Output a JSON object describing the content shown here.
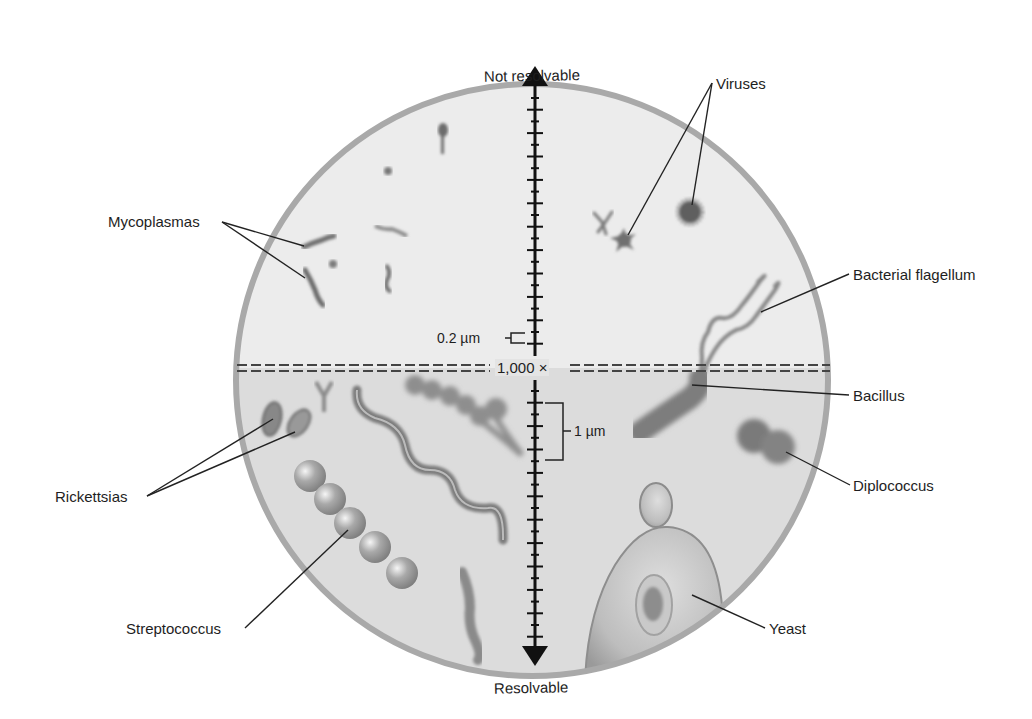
{
  "diagram": {
    "title_top": "Not resolvable",
    "title_bottom": "Resolvable",
    "magnification_label": "1,000 ×",
    "scale_small_label": "0.2 µm",
    "scale_large_label": "1 µm",
    "colors": {
      "field_upper": "#ececec",
      "field_lower": "#dcdcdc",
      "rim": "#a9a9a9",
      "organism": "#7a7a7a",
      "axis": "#111111",
      "leader_line": "#222222"
    },
    "labels": [
      {
        "id": "viruses",
        "text": "Viruses"
      },
      {
        "id": "mycoplasmas",
        "text": "Mycoplasmas"
      },
      {
        "id": "bacterial-flagellum",
        "text": "Bacterial flagellum"
      },
      {
        "id": "bacillus",
        "text": "Bacillus"
      },
      {
        "id": "rickettsias",
        "text": "Rickettsias"
      },
      {
        "id": "diplococcus",
        "text": "Diplococcus"
      },
      {
        "id": "streptococcus",
        "text": "Streptococcus"
      },
      {
        "id": "yeast",
        "text": "Yeast"
      }
    ]
  }
}
